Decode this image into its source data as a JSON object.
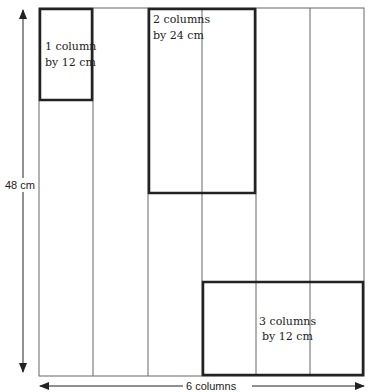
{
  "diagram": {
    "height_label": "48 cm",
    "width_label": "6 columns",
    "columns": 6,
    "height_cm": 48,
    "blocks": [
      {
        "label_line1": "1 column",
        "label_line2": "by 12 cm",
        "col_start": 1,
        "col_span": 1,
        "row_start_cm": 0,
        "height_cm": 12
      },
      {
        "label_line1": "2 columns",
        "label_line2": "by 24 cm",
        "col_start": 3,
        "col_span": 2,
        "row_start_cm": 0,
        "height_cm": 24
      },
      {
        "label_line1": "3 columns",
        "label_line2": "by 12 cm",
        "col_start": 4,
        "col_span": 3,
        "row_start_cm": 36,
        "height_cm": 12
      }
    ],
    "colors": {
      "line": "#555555",
      "block": "#222222",
      "text": "#222222"
    }
  }
}
